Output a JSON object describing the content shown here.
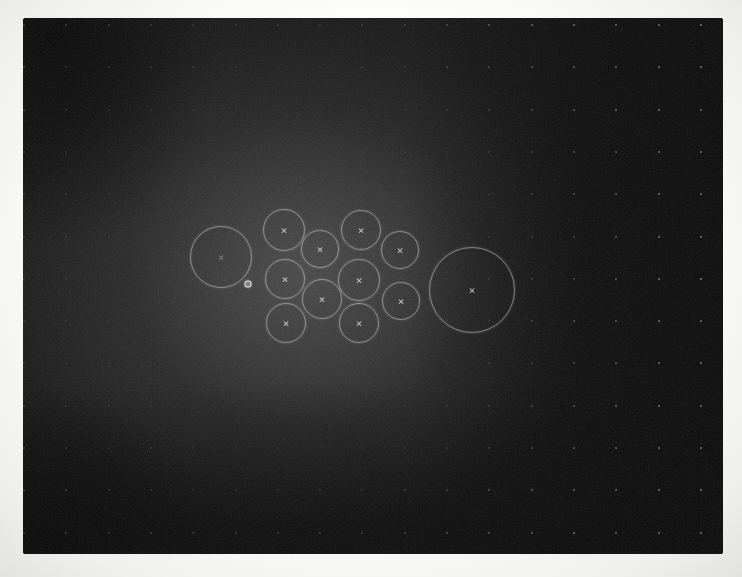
{
  "scene": {
    "marker_glyph": "×",
    "colors": {
      "paper_white": "#f7f7f5",
      "screen_black": "#0b0b0b",
      "glow_gray": "#3d3d3d",
      "stroke_gray": "#d0d0d0",
      "grid_dot_gray": "#9c9c9c"
    },
    "screen": {
      "left": 23,
      "top": 18,
      "width": 700,
      "height": 536
    },
    "glow_center": {
      "x": 305,
      "y": 268
    },
    "grid": {
      "x0": 24,
      "y0": 25,
      "pitch": 42.3,
      "cols": 17,
      "rows": 13
    },
    "cursor": {
      "x": 248,
      "y": 284
    },
    "circles": [
      {
        "id": "circle-large-left",
        "cx": 220,
        "cy": 256,
        "r": 30,
        "marker_opacity": 0.45
      },
      {
        "id": "circle-large-right",
        "cx": 471,
        "cy": 289,
        "r": 42
      },
      {
        "id": "circle-small-1",
        "cx": 283,
        "cy": 229,
        "r": 20
      },
      {
        "id": "circle-small-2",
        "cx": 360,
        "cy": 229,
        "r": 19
      },
      {
        "id": "circle-small-3",
        "cx": 319,
        "cy": 248,
        "r": 18
      },
      {
        "id": "circle-small-4",
        "cx": 399,
        "cy": 249,
        "r": 18
      },
      {
        "id": "circle-small-5",
        "cx": 284,
        "cy": 278,
        "r": 19
      },
      {
        "id": "circle-small-6",
        "cx": 358,
        "cy": 279,
        "r": 20
      },
      {
        "id": "circle-small-7",
        "cx": 321,
        "cy": 298,
        "r": 19
      },
      {
        "id": "circle-small-8",
        "cx": 400,
        "cy": 300,
        "r": 18
      },
      {
        "id": "circle-small-9",
        "cx": 285,
        "cy": 322,
        "r": 19
      },
      {
        "id": "circle-small-10",
        "cx": 358,
        "cy": 322,
        "r": 19
      }
    ]
  }
}
